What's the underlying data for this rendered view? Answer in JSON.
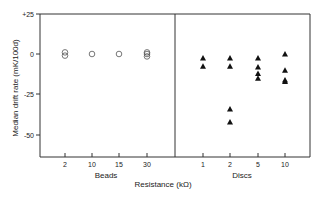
{
  "chart_data": {
    "type": "scatter",
    "title": "",
    "xlabel": "Resistance (kΩ)",
    "ylabel": "Median drift rate (mK/100d)",
    "ylim": [
      -65,
      25
    ],
    "yticks": [
      "+25",
      "0",
      "-25",
      "-50"
    ],
    "ytick_values": [
      25,
      0,
      -25,
      -50
    ],
    "grid": false,
    "legend": null,
    "panels": [
      {
        "name": "Beads",
        "marker": "open-circle",
        "categories": [
          "2",
          "10",
          "15",
          "30"
        ],
        "series": [
          {
            "category": "2",
            "values": [
              1,
              -1
            ]
          },
          {
            "category": "10",
            "values": [
              0
            ]
          },
          {
            "category": "15",
            "values": [
              0
            ]
          },
          {
            "category": "30",
            "values": [
              1,
              0,
              -1.5
            ]
          }
        ]
      },
      {
        "name": "Discs",
        "marker": "filled-triangle",
        "categories": [
          "1",
          "2",
          "5",
          "10"
        ],
        "series": [
          {
            "category": "1",
            "values": [
              -2.5,
              -7.5
            ]
          },
          {
            "category": "2",
            "values": [
              -2.5,
              -7.5,
              -34,
              -42
            ]
          },
          {
            "category": "5",
            "values": [
              -2.5,
              -8,
              -12,
              -15
            ]
          },
          {
            "category": "10",
            "values": [
              0,
              -10,
              -16,
              -17
            ]
          }
        ]
      }
    ]
  },
  "labels": {
    "ylabel": "Median drift rate   (mK/100d)",
    "xlabel": "Resistance (kΩ)",
    "panel_left": "Beads",
    "panel_right": "Discs",
    "yticks": [
      "+25",
      "0",
      "-25",
      "-50"
    ],
    "xticks_left": [
      "2",
      "10",
      "15",
      "30"
    ],
    "xticks_right": [
      "1",
      "2",
      "5",
      "10"
    ]
  }
}
